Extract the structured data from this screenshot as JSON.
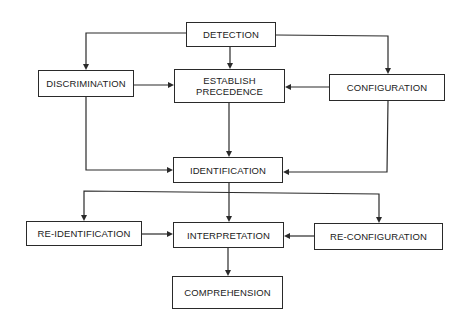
{
  "diagram": {
    "type": "flowchart",
    "nodes": {
      "detection": {
        "label": "DETECTION"
      },
      "discrimination": {
        "label": "DISCRIMINATION"
      },
      "establish_precedence": {
        "label_line1": "ESTABLISH",
        "label_line2": "PRECEDENCE"
      },
      "configuration": {
        "label": "CONFIGURATION"
      },
      "identification": {
        "label": "IDENTIFICATION"
      },
      "re_identification": {
        "label": "RE-IDENTIFICATION"
      },
      "interpretation": {
        "label": "INTERPRETATION"
      },
      "re_configuration": {
        "label": "RE-CONFIGURATION"
      },
      "comprehension": {
        "label": "COMPREHENSION"
      }
    },
    "edges": [
      {
        "from": "DETECTION",
        "to": "DISCRIMINATION"
      },
      {
        "from": "DETECTION",
        "to": "ESTABLISH PRECEDENCE"
      },
      {
        "from": "DETECTION",
        "to": "CONFIGURATION"
      },
      {
        "from": "DISCRIMINATION",
        "to": "ESTABLISH PRECEDENCE"
      },
      {
        "from": "CONFIGURATION",
        "to": "ESTABLISH PRECEDENCE"
      },
      {
        "from": "DISCRIMINATION",
        "to": "IDENTIFICATION"
      },
      {
        "from": "ESTABLISH PRECEDENCE",
        "to": "IDENTIFICATION"
      },
      {
        "from": "CONFIGURATION",
        "to": "IDENTIFICATION"
      },
      {
        "from": "IDENTIFICATION",
        "to": "RE-IDENTIFICATION"
      },
      {
        "from": "IDENTIFICATION",
        "to": "INTERPRETATION"
      },
      {
        "from": "IDENTIFICATION",
        "to": "RE-CONFIGURATION"
      },
      {
        "from": "RE-IDENTIFICATION",
        "to": "INTERPRETATION"
      },
      {
        "from": "RE-CONFIGURATION",
        "to": "INTERPRETATION"
      },
      {
        "from": "INTERPRETATION",
        "to": "COMPREHENSION"
      }
    ]
  }
}
